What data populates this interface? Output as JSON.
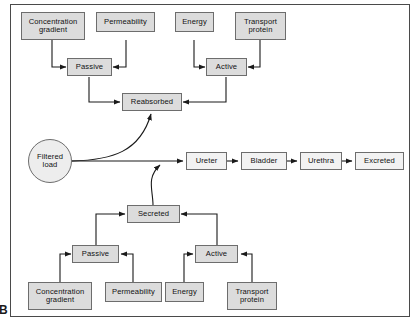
{
  "figure": {
    "panel_label": "B",
    "title": "",
    "border_color": "#4a4a4a",
    "node_fill": "#dcdcdc",
    "node_fill_light": "#f2f2f2",
    "line_color": "#1a1a1a"
  },
  "nodes": {
    "reabsorption": {
      "concentration_gradient": "Concentration\ngradient",
      "concentration_gradient_line1": "Concentration",
      "concentration_gradient_line2": "gradient",
      "permeability": "Permeability",
      "energy": "Energy",
      "transport_protein_line1": "Transport",
      "transport_protein_line2": "protein",
      "passive": "Passive",
      "active": "Active",
      "reabsorbed": "Reabsorbed"
    },
    "flow": {
      "filtered_load_line1": "Filtered",
      "filtered_load_line2": "load",
      "ureter": "Ureter",
      "bladder": "Bladder",
      "urethra": "Urethra",
      "excreted": "Excreted"
    },
    "secretion": {
      "secreted": "Secreted",
      "passive": "Passive",
      "active": "Active",
      "concentration_gradient_line1": "Concentration",
      "concentration_gradient_line2": "gradient",
      "permeability": "Permeability",
      "energy": "Energy",
      "transport_protein_line1": "Transport",
      "transport_protein_line2": "protein"
    }
  }
}
